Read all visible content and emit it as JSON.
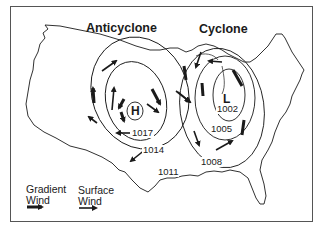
{
  "diagram": {
    "titles": {
      "anticyclone": "Anticyclone",
      "cyclone": "Cyclone"
    },
    "centers": {
      "high": "H",
      "low": "L"
    },
    "isobars": {
      "i1017": "1017",
      "i1014": "1014",
      "i1011": "1011",
      "i1002": "1002",
      "i1005": "1005",
      "i1008": "1008"
    },
    "legend": {
      "gradient_line1": "Gradient",
      "gradient_line2": "Wind",
      "surface_line1": "Surface",
      "surface_line2": "Wind"
    },
    "colors": {
      "ink": "#1a1a1a",
      "frame": "#555555",
      "background": "#ffffff"
    }
  }
}
